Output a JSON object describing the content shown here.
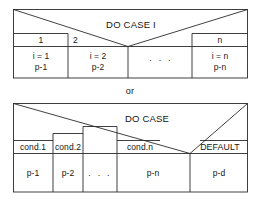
{
  "figure": {
    "separator_label": "or",
    "diagram_one": {
      "title": "DO CASE I",
      "case_labels": [
        "1",
        "2",
        "n"
      ],
      "ellipsis": ". . .",
      "cells": [
        {
          "line1": "i = 1",
          "line2": "p-1"
        },
        {
          "line1": "i = 2",
          "line2": "p-2"
        },
        {
          "line1": ". . .",
          "line2": ""
        },
        {
          "line1": "i = n",
          "line2": "p-n"
        }
      ]
    },
    "diagram_two": {
      "title": "DO CASE",
      "condition_labels": [
        "cond.1",
        "cond.2",
        "cond.n",
        "DEFAULT"
      ],
      "ellipsis": ". . .",
      "cells": [
        {
          "label": "p-1"
        },
        {
          "label": "p-2"
        },
        {
          "label": ". . ."
        },
        {
          "label": "p-n"
        },
        {
          "label": "p-d"
        }
      ]
    }
  },
  "style": {
    "line_color": "#2b2b2b",
    "text_color": "#151515",
    "background": "#ffffff"
  }
}
